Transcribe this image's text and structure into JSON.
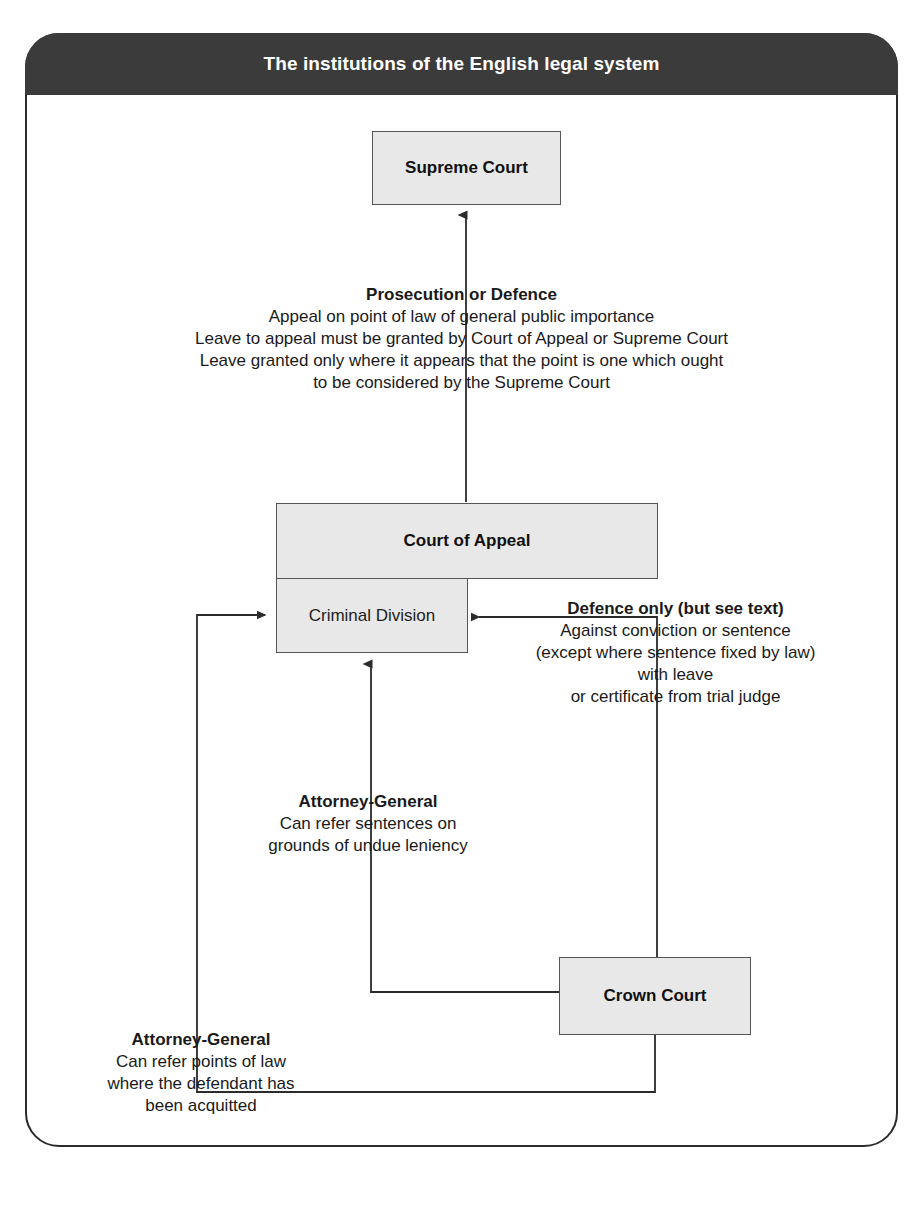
{
  "diagram": {
    "title": "The institutions of the English legal system",
    "type": "flowchart",
    "nodes": [
      {
        "id": "supreme-court",
        "label": "Supreme Court"
      },
      {
        "id": "court-of-appeal",
        "label": "Court of Appeal"
      },
      {
        "id": "criminal-division",
        "label": "Criminal Division"
      },
      {
        "id": "crown-court",
        "label": "Crown Court"
      }
    ],
    "annotations": {
      "prosecution_or_defence": {
        "heading": "Prosecution or Defence",
        "lines": [
          "Appeal on point of law of general public importance",
          "Leave to appeal must be granted by Court of Appeal or Supreme Court",
          "Leave granted only where it appears that the point is one which ought",
          "to be considered by the Supreme Court"
        ]
      },
      "defence_only": {
        "heading": "Defence only (but see text)",
        "lines": [
          "Against conviction or sentence",
          "(except where sentence fixed by law)",
          "with leave",
          "or certificate from trial judge"
        ]
      },
      "attorney_general_sentences": {
        "heading": "Attorney-General",
        "lines": [
          "Can refer sentences on",
          "grounds of undue leniency"
        ]
      },
      "attorney_general_points_of_law": {
        "heading": "Attorney-General",
        "lines": [
          "Can refer points of law",
          "where the defendant has",
          "been acquitted"
        ]
      }
    },
    "colors": {
      "title_bar": "#3b3b3b",
      "title_text": "#ffffff",
      "node_fill": "#e8e8e8",
      "node_border": "#555555",
      "frame_border": "#2b2b2b",
      "connector": "#2b2b2b"
    }
  }
}
